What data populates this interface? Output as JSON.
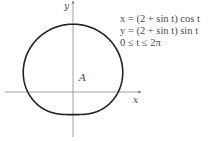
{
  "diagram": {
    "type": "parametric-curve",
    "axes": {
      "x_label": "x",
      "y_label": "y"
    },
    "region_label": "A",
    "equations": [
      "x = (2 + sin t) cos t",
      "y = (2 + sin t) sin t",
      "0 ≤ t ≤ 2π"
    ],
    "colors": {
      "curve": "#222222",
      "axis": "#777777",
      "text": "#4a4a4a"
    }
  }
}
